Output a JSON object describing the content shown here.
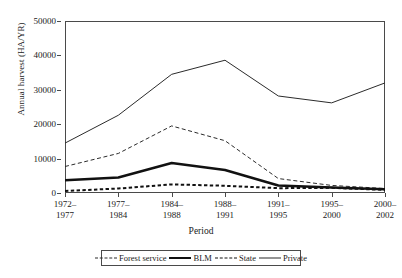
{
  "chart_data": {
    "type": "line",
    "title": "",
    "xlabel": "Period",
    "ylabel": "Annual harvest (HA/YR)",
    "categories": [
      "1972–\n1977",
      "1977–\n1984",
      "1984–\n1988",
      "1988–\n1991",
      "1991–\n1995",
      "1995–\n2000",
      "2000–\n2002"
    ],
    "category_lines": [
      [
        "1972–",
        "1977"
      ],
      [
        "1977–",
        "1984"
      ],
      [
        "1984–",
        "1988"
      ],
      [
        "1988–",
        "1991"
      ],
      [
        "1991–",
        "1995"
      ],
      [
        "1995–",
        "2000"
      ],
      [
        "2000–",
        "2002"
      ]
    ],
    "ylim": [
      0,
      50000
    ],
    "yticks": [
      0,
      10000,
      20000,
      30000,
      40000,
      50000
    ],
    "ytick_labels": [
      "0",
      "10000",
      "20000",
      "30000",
      "40000",
      "50000"
    ],
    "grid": false,
    "legend_position": "below",
    "series": [
      {
        "name": "Forest service",
        "style": "dashed-thin",
        "color": "#2b2b2b",
        "values": [
          7700,
          11500,
          19500,
          15200,
          4200,
          2200,
          1300
        ]
      },
      {
        "name": "BLM",
        "style": "solid-thick",
        "color": "#111111",
        "values": [
          3700,
          4500,
          8700,
          6700,
          2200,
          1600,
          1100
        ]
      },
      {
        "name": "State",
        "style": "dashed-thick",
        "color": "#111111",
        "values": [
          600,
          1300,
          2500,
          2100,
          1400,
          1500,
          900
        ]
      },
      {
        "name": "Private",
        "style": "solid-thin",
        "color": "#2b2b2b",
        "values": [
          14500,
          22600,
          34500,
          38600,
          28200,
          26200,
          32000
        ]
      }
    ]
  },
  "legend": {
    "items": [
      {
        "label": "Forest service"
      },
      {
        "label": "BLM"
      },
      {
        "label": "State"
      },
      {
        "label": "Private"
      }
    ]
  }
}
